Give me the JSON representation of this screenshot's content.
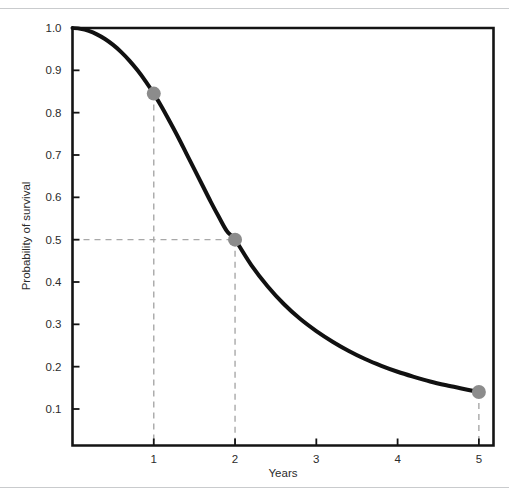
{
  "figure": {
    "name": "survival-probability-curve",
    "background_color": "#ffffff",
    "separator_color": "#c9cbcd"
  },
  "chart_data": {
    "type": "line",
    "title": "",
    "subtitle": "",
    "xlabel": "Years",
    "ylabel": "Probability of survival",
    "xlim": [
      0,
      5.18
    ],
    "ylim": [
      0,
      1.0
    ],
    "xticks": [
      1,
      2,
      3,
      4,
      5
    ],
    "xtick_labels": [
      "1",
      "2",
      "3",
      "4",
      "5"
    ],
    "yticks": [
      0.1,
      0.2,
      0.3,
      0.4,
      0.5,
      0.6,
      0.7,
      0.8,
      0.9,
      1.0
    ],
    "ytick_labels": [
      "0.1",
      "0.2",
      "0.3",
      "0.4",
      "0.5",
      "0.6",
      "0.7",
      "0.8",
      "0.9",
      "1.0"
    ],
    "grid": false,
    "legend": null,
    "series": [
      {
        "name": "Probability of survival",
        "color": "#111111",
        "line_width": 4,
        "x": [
          0.0,
          0.1,
          0.2,
          0.3,
          0.4,
          0.5,
          0.6,
          0.7,
          0.8,
          0.9,
          1.0,
          1.1,
          1.2,
          1.3,
          1.4,
          1.5,
          1.6,
          1.7,
          1.8,
          1.9,
          2.0,
          2.2,
          2.4,
          2.6,
          2.8,
          3.0,
          3.2,
          3.4,
          3.6,
          3.8,
          4.0,
          4.2,
          4.4,
          4.6,
          4.8,
          5.0
        ],
        "y": [
          1.0,
          0.998,
          0.993,
          0.985,
          0.974,
          0.96,
          0.943,
          0.923,
          0.9,
          0.874,
          0.845,
          0.813,
          0.778,
          0.742,
          0.704,
          0.666,
          0.628,
          0.59,
          0.554,
          0.52,
          0.5,
          0.44,
          0.39,
          0.348,
          0.313,
          0.284,
          0.259,
          0.237,
          0.218,
          0.202,
          0.188,
          0.176,
          0.165,
          0.156,
          0.148,
          0.14
        ]
      }
    ],
    "markers": [
      {
        "name": "point-year-1",
        "x": 1.0,
        "y": 0.845,
        "color": "#8c8c8c",
        "radius": 7,
        "guides": [
          "vertical"
        ]
      },
      {
        "name": "point-median-survival",
        "x": 2.0,
        "y": 0.5,
        "color": "#8c8c8c",
        "radius": 7,
        "guides": [
          "vertical",
          "horizontal"
        ]
      },
      {
        "name": "point-year-5",
        "x": 5.0,
        "y": 0.14,
        "color": "#8c8c8c",
        "radius": 7,
        "guides": [
          "vertical"
        ]
      }
    ],
    "guide_style": {
      "color": "#a8a8a8",
      "dash": "6 5",
      "width": 1.4
    },
    "annotations": []
  }
}
